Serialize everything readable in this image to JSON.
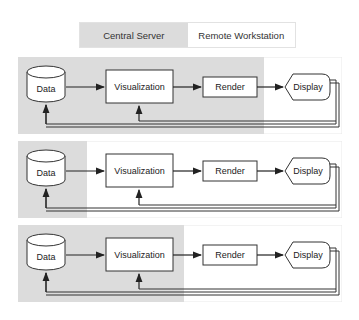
{
  "legend": {
    "central_server": "Central Server",
    "remote_workstation": "Remote Workstation"
  },
  "colors": {
    "server_region": "#dcdcdc",
    "remote_region": "#ffffff",
    "stroke": "#333333"
  },
  "nodes": {
    "data": "Data",
    "visualization": "Visualization",
    "render": "Render",
    "display": "Display"
  },
  "panels": [
    {
      "id": "config-1",
      "server_region_end_x": 246,
      "server_components": [
        "Data",
        "Visualization",
        "Render"
      ],
      "remote_components": [
        "Display"
      ]
    },
    {
      "id": "config-2",
      "server_region_end_x": 69,
      "server_components": [
        "Data"
      ],
      "remote_components": [
        "Visualization",
        "Render",
        "Display"
      ]
    },
    {
      "id": "config-3",
      "server_region_end_x": 166,
      "server_components": [
        "Data",
        "Visualization"
      ],
      "remote_components": [
        "Render",
        "Display"
      ]
    }
  ]
}
